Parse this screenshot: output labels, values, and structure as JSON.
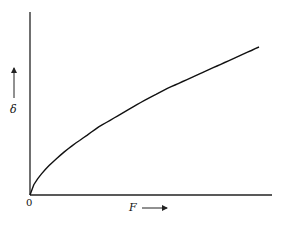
{
  "chart_data": {
    "type": "line",
    "title": "",
    "xlabel": "F",
    "ylabel": "δ",
    "origin_label": "0",
    "grid": false,
    "legend": null,
    "series": [
      {
        "name": "δ vs F",
        "x": [
          0,
          0.1,
          0.2,
          0.3,
          0.4,
          0.5,
          0.6,
          0.7,
          0.8,
          0.9,
          1.0
        ],
        "y": [
          0,
          0.22,
          0.35,
          0.46,
          0.55,
          0.64,
          0.72,
          0.79,
          0.86,
          0.93,
          1.0
        ]
      }
    ],
    "xlim": [
      0,
      1.06
    ],
    "ylim": [
      0,
      1.24
    ]
  },
  "labels": {
    "origin": "0",
    "x_axis": "F",
    "y_axis": "δ"
  }
}
